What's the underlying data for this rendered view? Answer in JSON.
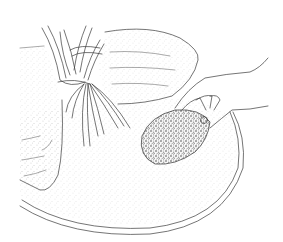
{
  "image": {
    "kind": "line-illustration",
    "width": 283,
    "height": 242,
    "background": "#ffffff",
    "ink_color": "#3a3a3a",
    "stipple_color": "#9a9a9a"
  },
  "elements": [
    {
      "name": "circular-dish",
      "description": "large stippled circular base / dish rim with double edge"
    },
    {
      "name": "mound-left",
      "description": "stippled mound on left with horizontal texture marks"
    },
    {
      "name": "mound-back",
      "description": "large rounded stippled mound in background"
    },
    {
      "name": "strand-bundle",
      "description": "bundle of twisted root-like strands tied at center, splaying downward"
    },
    {
      "name": "clump",
      "description": "dense granular clump being placed, dark speckled"
    },
    {
      "name": "hand",
      "description": "right hand and forearm entering from right, holding the clump"
    }
  ]
}
